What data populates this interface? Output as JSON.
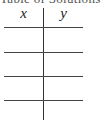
{
  "title_cropped": "Table of Solutions",
  "table": {
    "columns": [
      "x",
      "y"
    ],
    "rows": [
      {
        "x": "",
        "y": ""
      },
      {
        "x": "",
        "y": ""
      },
      {
        "x": "",
        "y": ""
      },
      {
        "x": "",
        "y": ""
      }
    ]
  }
}
